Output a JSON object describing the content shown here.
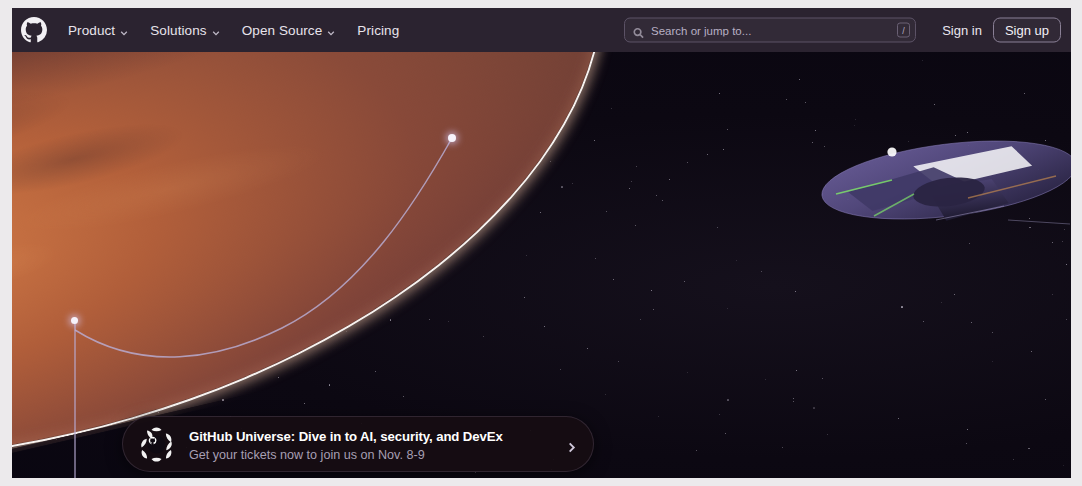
{
  "header": {
    "logo_icon": "github-mark-icon",
    "nav": [
      {
        "label": "Product",
        "has_dropdown": true,
        "icon": "chevron-down-icon"
      },
      {
        "label": "Solutions",
        "has_dropdown": true,
        "icon": "chevron-down-icon"
      },
      {
        "label": "Open Source",
        "has_dropdown": true,
        "icon": "chevron-down-icon"
      },
      {
        "label": "Pricing",
        "has_dropdown": false,
        "icon": ""
      }
    ],
    "search": {
      "icon": "search-icon",
      "placeholder": "Search or jump to...",
      "value": "",
      "shortcut_key": "/"
    },
    "sign_in_label": "Sign in",
    "sign_up_label": "Sign up",
    "background_color": "#2b2330"
  },
  "hero": {
    "scene": "mars-planet-with-spacecraft",
    "planet_color": "#c4753f",
    "limb_color": "#fffaf6",
    "space_color": "#0b0710",
    "connector_color": "#b9aed6",
    "spacecraft_color": "#5b5180",
    "spacecraft_accent": "#7ee06a"
  },
  "banner": {
    "logo_icon": "github-universe-icon",
    "title": "GitHub Universe: Dive in to AI, security, and DevEx",
    "subtitle": "Get your tickets now to join us on Nov. 8-9",
    "chevron_icon": "chevron-right-icon",
    "background_color": "#160d12",
    "title_color": "#ffffff",
    "subtitle_color": "#a79fb3"
  }
}
